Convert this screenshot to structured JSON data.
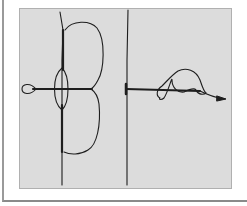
{
  "figure": {
    "type": "hand-drawn locus diagram",
    "panels": [
      {
        "name": "left-plot",
        "description": "symmetric lobes about real axis with small loop at left"
      },
      {
        "name": "right-plot",
        "description": "looping trajectory along real axis ending in arrow"
      }
    ]
  },
  "colors": {
    "panel_background": "#dcdcdc",
    "ink": "#1e1e1e",
    "frame": "#9a9a9a"
  }
}
